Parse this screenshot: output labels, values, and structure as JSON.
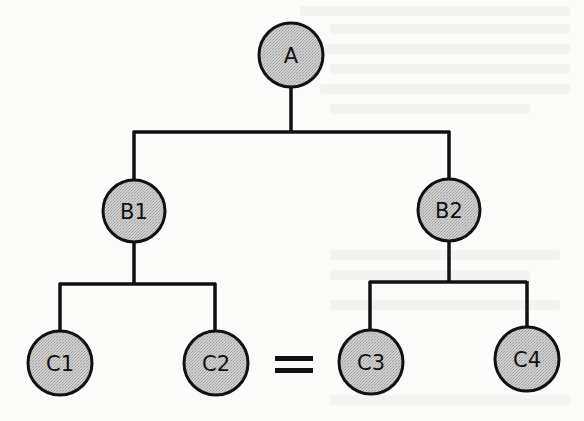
{
  "diagram": {
    "type": "tree",
    "colors": {
      "node_fill": "#c9c9c9",
      "node_stroke": "#111111",
      "edge": "#111111",
      "background": "#fbfbfa"
    },
    "nodes": [
      {
        "id": "A",
        "label": "A",
        "cx": 291,
        "cy": 55,
        "r": 32
      },
      {
        "id": "B1",
        "label": "B1",
        "cx": 134,
        "cy": 211,
        "r": 31
      },
      {
        "id": "B2",
        "label": "B2",
        "cx": 449,
        "cy": 210,
        "r": 31
      },
      {
        "id": "C1",
        "label": "C1",
        "cx": 60,
        "cy": 363,
        "r": 32
      },
      {
        "id": "C2",
        "label": "C2",
        "cx": 216,
        "cy": 363,
        "r": 32
      },
      {
        "id": "C3",
        "label": "C3",
        "cx": 371,
        "cy": 362,
        "r": 32
      },
      {
        "id": "C4",
        "label": "C4",
        "cx": 527,
        "cy": 359,
        "r": 32
      }
    ],
    "edges": [
      {
        "from": "A",
        "to": "B1"
      },
      {
        "from": "A",
        "to": "B2"
      },
      {
        "from": "B1",
        "to": "C1"
      },
      {
        "from": "B1",
        "to": "C2"
      },
      {
        "from": "B2",
        "to": "C3"
      },
      {
        "from": "B2",
        "to": "C4"
      }
    ],
    "relation": {
      "symbol": "=",
      "between": [
        "C2",
        "C3"
      ]
    }
  }
}
